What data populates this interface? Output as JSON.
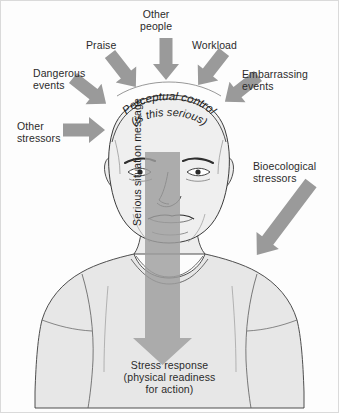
{
  "diagram": {
    "center_label_line1": "Perceptual control",
    "center_label_line2": "(is this serious)",
    "vertical_arrow_label": "Serious situation message",
    "outcome": "Stress response\n(physical readiness\nfor action)",
    "stressors": [
      {
        "id": "praise",
        "label": "Praise"
      },
      {
        "id": "other-people",
        "label": "Other\npeople"
      },
      {
        "id": "workload",
        "label": "Workload"
      },
      {
        "id": "dangerous",
        "label": "Dangerous\nevents"
      },
      {
        "id": "embarrassing",
        "label": "Embarrassing\nevents"
      },
      {
        "id": "other-stressors",
        "label": "Other\nstressors"
      },
      {
        "id": "bioecological",
        "label": "Bioecological\nstressors"
      }
    ],
    "colors": {
      "arrow_fill": "#9a9a9a",
      "arrow_stroke": "#8c8c8c",
      "vertical_arrow_fill": "#9d9d9d",
      "skin_fill": "#efefef",
      "shirt_fill": "#e6e6e6",
      "outline": "#3a3a3a",
      "text": "#2b2b2b",
      "background": "#fdfdfd",
      "border": "#d8d8d8"
    }
  }
}
